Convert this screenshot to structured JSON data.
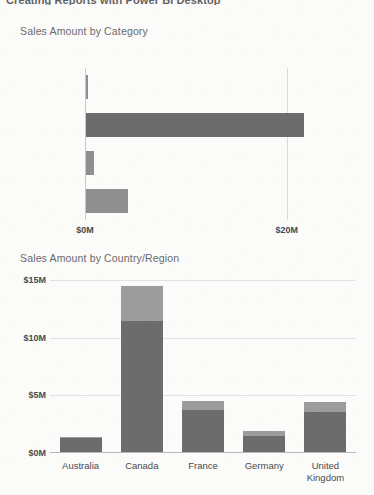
{
  "page": {
    "heading": "Creating Reports with Power BI Desktop"
  },
  "colors": {
    "background": "#fbfbfa",
    "bar_dark": "#6c6c6c",
    "bar_light": "#919191",
    "segment_top": "#9c9c9c",
    "gridline": "#e2e2e2",
    "axis": "#b9b9b9",
    "title_text": "#6a6a6a",
    "label_text": "#4a4a4a"
  },
  "chart_data": [
    {
      "type": "bar",
      "orientation": "horizontal",
      "title": "Sales Amount by Category",
      "xlabel": "",
      "ylabel": "",
      "categories": [
        "Accessories",
        "Bikes",
        "Clothing",
        "Components"
      ],
      "values": [
        0.2,
        21.6,
        0.8,
        4.2
      ],
      "value_unit": "$M",
      "xlim": [
        0,
        23.4
      ],
      "xticks": [
        0,
        20
      ],
      "xtick_labels": [
        "$0M",
        "$20M"
      ],
      "grid": true,
      "legend": "none",
      "bar_colors": [
        "#8f8f8f",
        "#6c6c6c",
        "#8f8f8f",
        "#8f8f8f"
      ]
    },
    {
      "type": "bar",
      "orientation": "vertical",
      "stacked": true,
      "title": "Sales Amount by Country/Region",
      "xlabel": "",
      "ylabel": "",
      "categories": [
        "Australia",
        "Canada",
        "France",
        "Germany",
        "United\nKingdom"
      ],
      "series": [
        {
          "name": "segment-lower",
          "color": "#6c6c6c",
          "values": [
            1.2,
            11.4,
            3.6,
            1.4,
            3.5
          ]
        },
        {
          "name": "segment-upper",
          "color": "#9c9c9c",
          "values": [
            0.1,
            3.0,
            0.8,
            0.4,
            0.8
          ]
        }
      ],
      "totals": [
        1.3,
        14.4,
        4.4,
        1.8,
        4.3
      ],
      "value_unit": "$M",
      "ylim": [
        0,
        15
      ],
      "yticks": [
        0,
        5,
        10,
        15
      ],
      "ytick_labels": [
        "$0M",
        "$5M",
        "$10M",
        "$15M"
      ],
      "grid": true,
      "legend": "none"
    }
  ]
}
